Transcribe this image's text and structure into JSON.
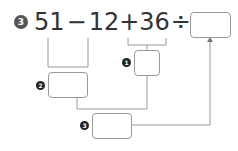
{
  "problem": {
    "number": "3",
    "tokens": [
      "51",
      "−",
      "12",
      "+",
      "36",
      "÷",
      "4",
      "="
    ],
    "answer": ""
  },
  "steps": [
    {
      "label": "1",
      "value": ""
    },
    {
      "label": "2",
      "value": ""
    },
    {
      "label": "3",
      "value": ""
    }
  ],
  "colors": {
    "text": "#333333",
    "line": "#9a9a9a",
    "badge": "#555555",
    "step_badge": "#222222"
  }
}
